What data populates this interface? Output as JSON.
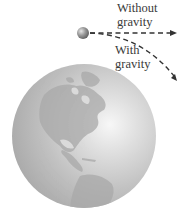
{
  "diagram": {
    "labels": {
      "without_line1": "Without",
      "without_line2": "gravity",
      "with_line1": "With",
      "with_line2": "gravity"
    },
    "elements": {
      "projectile": "ball-icon",
      "earth": "globe-icon",
      "straight_path": "dashed-arrow-without-gravity",
      "curved_path": "dashed-arrow-with-gravity"
    },
    "colors": {
      "earth_light": "#f2f2f2",
      "earth_mid": "#bdbdbd",
      "earth_dark": "#9a9a9a",
      "land": "#a8a8a8",
      "ball": "#8a8a8a",
      "arrow": "#333333",
      "text": "#3a3a3a"
    }
  }
}
